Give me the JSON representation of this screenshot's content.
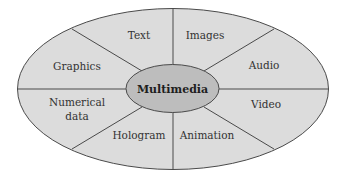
{
  "diagram": {
    "center": {
      "label": "Multimedia"
    },
    "segments": [
      {
        "id": "text",
        "label": "Text"
      },
      {
        "id": "images",
        "label": "Images"
      },
      {
        "id": "audio",
        "label": "Audio"
      },
      {
        "id": "video",
        "label": "Video"
      },
      {
        "id": "animation",
        "label": "Animation"
      },
      {
        "id": "hologram",
        "label": "Hologram"
      },
      {
        "id": "numerical-data",
        "label_line1": "Numerical",
        "label_line2": "data"
      },
      {
        "id": "graphics",
        "label": "Graphics"
      }
    ],
    "colors": {
      "outer_fill": "#dcdcdc",
      "inner_fill": "#bdbdbd",
      "stroke": "#4a4a4a",
      "background": "#ffffff"
    }
  }
}
